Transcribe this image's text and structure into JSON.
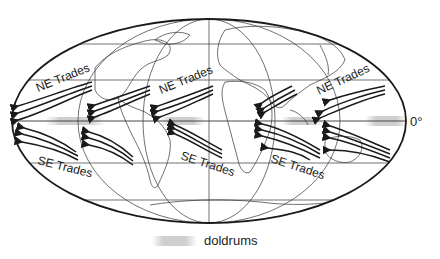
{
  "map": {
    "title": "Trade winds and doldrums",
    "projection": "elliptical world map",
    "equator_label": "0°",
    "wind_labels": [
      {
        "text": "NE Trades",
        "x": 38,
        "y": 92,
        "rot": -22
      },
      {
        "text": "NE Trades",
        "x": 161,
        "y": 94,
        "rot": -22
      },
      {
        "text": "NE Trades",
        "x": 319,
        "y": 95,
        "rot": -25
      },
      {
        "text": "SE Trades",
        "x": 37,
        "y": 164,
        "rot": 14
      },
      {
        "text": "SE Trades",
        "x": 180,
        "y": 159,
        "rot": 18
      },
      {
        "text": "SE Trades",
        "x": 270,
        "y": 162,
        "rot": 18
      }
    ],
    "legend": {
      "label": "doldrums",
      "swatch_color": "#cfcfcf"
    },
    "colors": {
      "ink": "#1a1a1a",
      "doldrums": "#cfcfcf",
      "background": "#ffffff"
    }
  }
}
